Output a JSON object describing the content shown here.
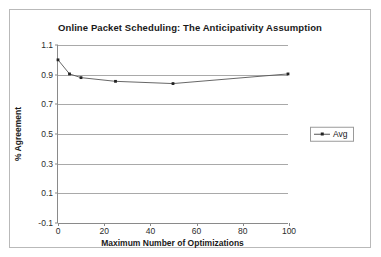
{
  "chart_data": {
    "type": "line",
    "title": "Online Packet Scheduling: The Anticipativity Assumption",
    "xlabel": "Maximum Number of Optimizations",
    "ylabel": "% Agreement",
    "xlim": [
      0,
      100
    ],
    "ylim": [
      -0.1,
      1.1
    ],
    "grid": true,
    "legend_position": "right",
    "xticks": [
      "0",
      "20",
      "40",
      "60",
      "80",
      "100"
    ],
    "xtick_values": [
      0,
      20,
      40,
      60,
      80,
      100
    ],
    "yticks": [
      "-0.1",
      "0.1",
      "0.3",
      "0.5",
      "0.7",
      "0.9",
      "1.1"
    ],
    "ytick_values": [
      -0.1,
      0.1,
      0.3,
      0.5,
      0.7,
      0.9,
      1.1
    ],
    "series": [
      {
        "name": "Avg",
        "color": "#555555",
        "marker_color": "#222222",
        "x": [
          0,
          5,
          10,
          25,
          50,
          100
        ],
        "values": [
          1.0,
          0.905,
          0.88,
          0.855,
          0.84,
          0.905
        ]
      }
    ]
  },
  "legend": {
    "entries": [
      {
        "label": "Avg"
      }
    ]
  }
}
